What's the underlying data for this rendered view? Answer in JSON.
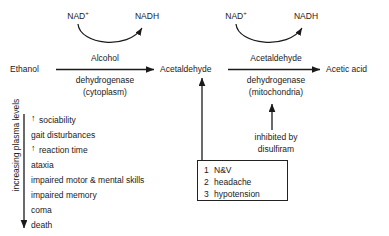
{
  "diagram": {
    "metabolites": {
      "ethanol": "Ethanol",
      "acetaldehyde": "Acetaldehyde",
      "acetic_acid": "Acetic acid"
    },
    "cofactors": {
      "nad_left": "NAD",
      "nad_left_charge": "+",
      "nadh_left": "NADH",
      "nad_right": "NAD",
      "nad_right_charge": "+",
      "nadh_right": "NADH"
    },
    "enzymes": {
      "left": {
        "name_line1": "Alcohol",
        "name_line2": "dehydrogenase",
        "location": "(cytoplasm)"
      },
      "right": {
        "name_line1": "Acetaldehyde",
        "name_line2": "dehydrogenase",
        "location": "(mitochondria)"
      }
    },
    "inhibition": {
      "line1": "inhibited by",
      "line2": "disulfiram"
    },
    "adverse_effects_box": {
      "items": [
        {
          "num": "1",
          "text": "N&V"
        },
        {
          "num": "2",
          "text": "headache"
        },
        {
          "num": "3",
          "text": "hypotension"
        }
      ]
    },
    "plasma_scale": {
      "axis_label": "increasing plasma levels",
      "symptoms": [
        {
          "arrow": "↑",
          "text": "sociability"
        },
        {
          "arrow": "",
          "text": "gait disturbances"
        },
        {
          "arrow": "↑",
          "text": "reaction time"
        },
        {
          "arrow": "",
          "text": "ataxia"
        },
        {
          "arrow": "",
          "text": "impaired motor & mental skills"
        },
        {
          "arrow": "",
          "text": "impaired memory"
        },
        {
          "arrow": "",
          "text": "coma"
        },
        {
          "arrow": "",
          "text": "death"
        }
      ]
    },
    "colors": {
      "ink": "#1a1a1a",
      "stroke": "#222222",
      "background": "#ffffff"
    }
  }
}
